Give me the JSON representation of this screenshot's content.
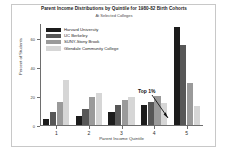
{
  "chart_data": {
    "type": "bar",
    "title": "Parent Income Distributions by Quintile for 1980-82 Birth Cohorts",
    "subtitle": "At Selected Colleges",
    "xlabel": "Parent Income Quintile",
    "ylabel": "Percent of Students",
    "categories": [
      "1",
      "2",
      "3",
      "4",
      "5"
    ],
    "ylim": [
      0,
      70
    ],
    "yticks": [
      0,
      20,
      40,
      60
    ],
    "ytick_labels": [
      "0",
      "20",
      "40",
      "60"
    ],
    "grid": false,
    "legend_position": "top-left",
    "series": [
      {
        "name": "Harvard University",
        "color": "#1c1c1c",
        "values": [
          4,
          6,
          9,
          14,
          67
        ]
      },
      {
        "name": "UC Berkeley",
        "color": "#575757",
        "values": [
          9,
          11,
          14,
          16,
          55
        ]
      },
      {
        "name": "SUNY-Stony Brook",
        "color": "#9a9a9a",
        "values": [
          16,
          19,
          17,
          20,
          29
        ]
      },
      {
        "name": "Glendale Community College",
        "color": "#d6d6d6",
        "values": [
          31,
          22,
          19,
          15,
          13
        ]
      }
    ],
    "annotations": [
      {
        "text": "Top 1%",
        "target_series": "Harvard University",
        "target_category": "5"
      }
    ]
  }
}
